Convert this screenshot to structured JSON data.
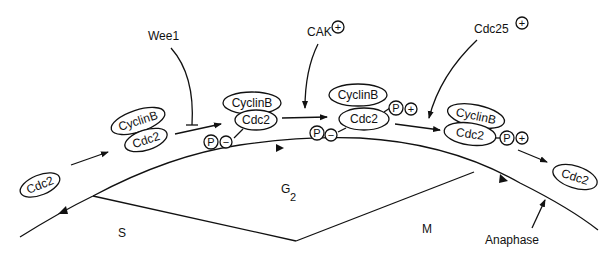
{
  "diagram": {
    "regulators": {
      "wee1": {
        "label": "Wee1",
        "effect": "inhibits"
      },
      "cak": {
        "label": "CAK",
        "sign": "+"
      },
      "cdc25": {
        "label": "Cdc25",
        "sign": "+"
      }
    },
    "states": [
      {
        "id": "free-cdc2-start",
        "molecules": [
          "Cdc2"
        ]
      },
      {
        "id": "complex-1",
        "molecules": [
          "CyclinB",
          "Cdc2"
        ]
      },
      {
        "id": "complex-2",
        "molecules": [
          "CyclinB",
          "Cdc2"
        ],
        "phosphates": [
          {
            "label": "P",
            "sign": "−"
          }
        ]
      },
      {
        "id": "complex-3",
        "molecules": [
          "CyclinB",
          "Cdc2"
        ],
        "phosphates": [
          {
            "label": "P",
            "sign": "+"
          },
          {
            "label": "P",
            "sign": "−"
          }
        ]
      },
      {
        "id": "complex-4",
        "molecules": [
          "CyclinB",
          "Cdc2"
        ],
        "phosphates": [
          {
            "label": "P",
            "sign": "+"
          }
        ]
      },
      {
        "id": "free-cdc2-end",
        "molecules": [
          "Cdc2"
        ]
      }
    ],
    "labels": {
      "cyclinb": "CyclinB",
      "cdc2": "Cdc2",
      "p": "P",
      "plus": "+",
      "minus": "−"
    },
    "phases": {
      "s": "S",
      "g2": "G",
      "g2_sub": "2",
      "m": "M",
      "anaphase": "Anaphase"
    }
  }
}
